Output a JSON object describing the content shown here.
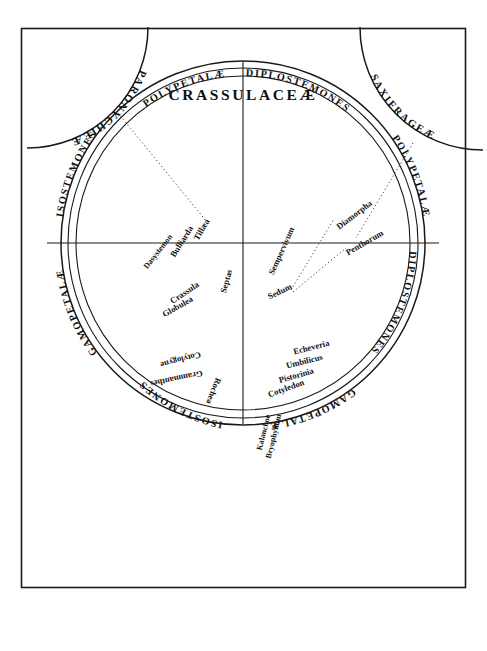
{
  "plate": {
    "title": "CRASSULACEÆ",
    "frame_color": "#1a1a1a",
    "background": "#ffffff",
    "width": 487,
    "height": 651
  },
  "corner_families": [
    {
      "label": "PARONYCHIEÆ",
      "position": "top-left"
    },
    {
      "label": "SAXIFRAGEÆ",
      "position": "top-right"
    }
  ],
  "outer_ring_labels": [
    {
      "label": "POLYPETALÆ",
      "quadrant": "upper-left",
      "ring": "inner"
    },
    {
      "label": "ISOSTEMONES",
      "quadrant": "upper-left",
      "ring": "outer"
    },
    {
      "label": "DIPLOSTEMONES",
      "quadrant": "upper-right",
      "ring": "inner"
    },
    {
      "label": "POLYPETALÆ",
      "quadrant": "upper-right",
      "ring": "outer"
    },
    {
      "label": "DIPLOSTEMONES",
      "quadrant": "lower-right",
      "ring": "inner"
    },
    {
      "label": "GAMOPETALÆ",
      "quadrant": "lower-right",
      "ring": "outer"
    },
    {
      "label": "ISOSTEMONES",
      "quadrant": "lower-left",
      "ring": "inner"
    },
    {
      "label": "GAMOPETALÆ",
      "quadrant": "lower-left",
      "ring": "outer"
    }
  ],
  "quadrants": {
    "upper_left": {
      "axes": [
        "ISOSTEMONES",
        "POLYPETALÆ"
      ],
      "genera": [
        "Tillæa",
        "Bulliarda",
        "Dasystemon",
        "Septas",
        "Crassula",
        "Globulea"
      ]
    },
    "upper_right": {
      "axes": [
        "DIPLOSTEMONES",
        "POLYPETALÆ"
      ],
      "genera": [
        "Sempervivum",
        "Sedum",
        "Diamorpha",
        "Penthorum"
      ]
    },
    "lower_right": {
      "axes": [
        "DIPLOSTEMONES",
        "GAMOPETALÆ"
      ],
      "genera": [
        "Echeveria",
        "Umbilicus",
        "Pistorinia",
        "Cotyledon",
        "Kalanchoe",
        "Bryophyllum"
      ]
    },
    "lower_left": {
      "axes": [
        "ISOSTEMONES",
        "GAMOPETALÆ"
      ],
      "genera": [
        "Cotylogyne",
        "Grammanthes",
        "Rochea"
      ]
    }
  },
  "leaders": [
    {
      "from": "PARONYCHIEÆ",
      "to": "Tillæa"
    },
    {
      "from": "SAXIFRAGEÆ",
      "to": "Penthorum"
    },
    {
      "from": "Sedum",
      "to": "Diamorpha"
    },
    {
      "from": "Sedum",
      "to": "Penthorum"
    }
  ]
}
